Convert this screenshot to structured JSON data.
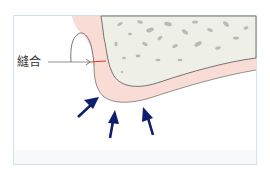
{
  "diagram": {
    "labels": {
      "suture": "縫合"
    },
    "regions": [
      {
        "name": "bone",
        "color": "#eef0e8",
        "texture": "cancellous pores"
      },
      {
        "name": "gingiva",
        "color": "#f9dcd6"
      },
      {
        "name": "background",
        "color": "#ffffff"
      }
    ],
    "arrows": {
      "count": 3,
      "color": "#0f1f6e",
      "direction": "pointing toward gingiva curve"
    },
    "colors": {
      "frame_border": "#cfe3ea",
      "outline": "#555555",
      "suture_line": "#e03a2a",
      "leader_line": "#777777",
      "arrow": "#0f1f6e",
      "gingiva": "#f9dcd6",
      "bone": "#eef0e8",
      "pore": "#b7bcb3"
    }
  }
}
